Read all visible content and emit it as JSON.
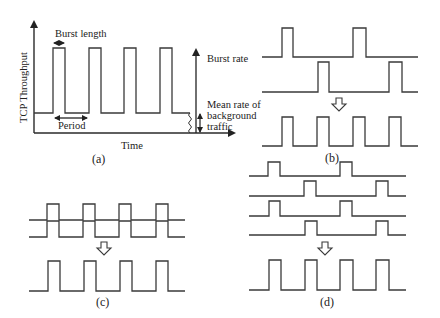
{
  "panel_a": {
    "caption": "(a)",
    "ylabel": "TCP Throughput",
    "xlabel": "Time",
    "burst_length_label": "Burst length",
    "period_label": "Period",
    "burst_rate_label": "Burst rate",
    "mean_rate_label": [
      "Mean rate of",
      "background",
      "traffic"
    ],
    "signal": {
      "x_start": 34,
      "x_end": 190,
      "base_y": 113,
      "top_y": 48,
      "pulses": [
        [
          53,
          65
        ],
        [
          89,
          101
        ],
        [
          124,
          136
        ],
        [
          160,
          172
        ]
      ]
    }
  },
  "panel_b": {
    "caption": "(b)",
    "inputs": [
      {
        "x_start": 262,
        "x_end": 418,
        "base_y": 57,
        "top_y": 28,
        "pulses": [
          [
            282,
            293
          ],
          [
            353,
            366
          ]
        ]
      },
      {
        "x_start": 262,
        "x_end": 418,
        "base_y": 92,
        "top_y": 62,
        "pulses": [
          [
            318,
            329
          ],
          [
            389,
            402
          ]
        ]
      }
    ],
    "output": {
      "x_start": 262,
      "x_end": 418,
      "base_y": 146,
      "top_y": 117,
      "pulses": [
        [
          282,
          293
        ],
        [
          317,
          329
        ],
        [
          353,
          365
        ],
        [
          389,
          401
        ]
      ]
    }
  },
  "panel_c": {
    "caption": "(c)",
    "inputs": [
      {
        "x_start": 29,
        "x_end": 185,
        "base_y": 220,
        "top_y": 204,
        "pulses": [
          [
            47,
            59
          ],
          [
            83,
            95
          ],
          [
            119,
            131
          ],
          [
            156,
            168
          ]
        ]
      },
      {
        "x_start": 29,
        "x_end": 185,
        "base_y": 237,
        "top_y": 221,
        "pulses": [
          [
            47,
            59
          ],
          [
            83,
            95
          ],
          [
            119,
            131
          ],
          [
            156,
            168
          ]
        ]
      }
    ],
    "output": {
      "x_start": 29,
      "x_end": 185,
      "base_y": 291,
      "top_y": 261,
      "pulses": [
        [
          48,
          60
        ],
        [
          84,
          96
        ],
        [
          120,
          132
        ],
        [
          156,
          168
        ]
      ]
    }
  },
  "panel_d": {
    "caption": "(d)",
    "inputs": [
      {
        "x_start": 249,
        "x_end": 406,
        "base_y": 176,
        "top_y": 162,
        "pulses": [
          [
            268,
            280
          ],
          [
            340,
            352
          ]
        ]
      },
      {
        "x_start": 249,
        "x_end": 406,
        "base_y": 196,
        "top_y": 181,
        "pulses": [
          [
            304,
            316
          ],
          [
            376,
            388
          ]
        ]
      },
      {
        "x_start": 249,
        "x_end": 406,
        "base_y": 216,
        "top_y": 201,
        "pulses": [
          [
            269,
            280
          ],
          [
            340,
            352
          ]
        ]
      },
      {
        "x_start": 249,
        "x_end": 406,
        "base_y": 235,
        "top_y": 221,
        "pulses": [
          [
            305,
            317
          ],
          [
            376,
            388
          ]
        ]
      }
    ],
    "output": {
      "x_start": 249,
      "x_end": 406,
      "base_y": 290,
      "top_y": 260,
      "pulses": [
        [
          269,
          281
        ],
        [
          305,
          317
        ],
        [
          340,
          353
        ],
        [
          376,
          389
        ]
      ]
    }
  }
}
